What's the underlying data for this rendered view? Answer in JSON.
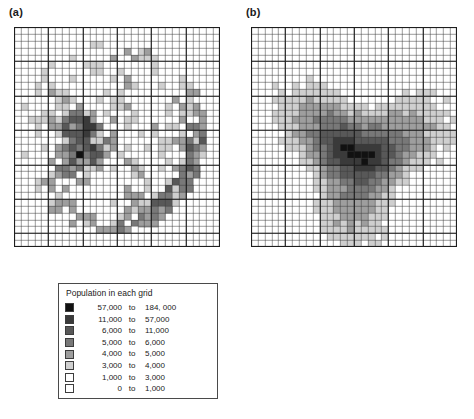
{
  "figure": {
    "type": "raster-map-pair",
    "background": "#ffffff"
  },
  "panels": [
    {
      "id": "a",
      "label": "(a)",
      "map_name": "population-density-grid-map",
      "grid": {
        "cols": 30,
        "rows": 32,
        "major_every": 5,
        "line_color": "#3c3c3c"
      }
    },
    {
      "id": "b",
      "label": "(b)",
      "map_name": "so2-concentration-grid-map",
      "grid": {
        "cols": 30,
        "rows": 32,
        "major_every": 5,
        "line_color": "#3c3c3c"
      }
    }
  ],
  "legend_a": {
    "title": "Population in each grid",
    "to_label": "to",
    "rows": [
      {
        "color": "#111111",
        "low": "57,000",
        "high": "184, 000"
      },
      {
        "color": "#3a3a3a",
        "low": "11,000",
        "high": "57,000"
      },
      {
        "color": "#585858",
        "low": "6,000",
        "high": "11,000"
      },
      {
        "color": "#787878",
        "low": "5,000",
        "high": "6,000"
      },
      {
        "color": "#9e9e9e",
        "low": "4,000",
        "high": "5,000"
      },
      {
        "color": "#cfcfcf",
        "low": "3,000",
        "high": "4,000"
      },
      {
        "color": "#ffffff",
        "low": "1,000",
        "high": "3,000"
      },
      {
        "color": "#ffffff",
        "low": "0",
        "high": "1,000"
      }
    ]
  },
  "legend_b": {
    "title_prefix": "SO",
    "title_sub": "2",
    "title_mid": " concentration, µg/m",
    "title_sup": "3",
    "to_label": "to",
    "rows": [
      {
        "color": "#111111",
        "low": "0.036",
        "high": "0.0794"
      },
      {
        "color": "#3a3a3a",
        "low": "0.0151",
        "high": "0.036"
      },
      {
        "color": "#585858",
        "low": "0.0078",
        "high": "0.0151"
      },
      {
        "color": "#787878",
        "low": "0.0045",
        "high": "0.0078"
      },
      {
        "color": "#9e9e9e",
        "low": "0.0028",
        "high": "0.0045"
      },
      {
        "color": "#cfcfcf",
        "low": "0.0016",
        "high": "0.0028"
      },
      {
        "color": "#ffffff",
        "low": "0.0011",
        "high": "0.0016"
      },
      {
        "color": "#ffffff",
        "low": "0.0001",
        "high": "0.0011"
      }
    ]
  },
  "chart_data": {
    "type": "heatmap",
    "title": "",
    "panels": [
      {
        "name": "(a) Population in each grid",
        "unit": "persons per grid cell",
        "class_breaks": [
          0,
          1000,
          3000,
          4000,
          5000,
          6000,
          11000,
          57000,
          184000
        ],
        "class_colors": [
          "#ffffff",
          "#ffffff",
          "#cfcfcf",
          "#9e9e9e",
          "#787878",
          "#585858",
          "#3a3a3a",
          "#111111"
        ],
        "grid_cols": 30,
        "grid_rows": 32,
        "shape": "irregular circular city boundary, clipped to circle",
        "pattern": "dense dark core slightly left-of-centre with radiating mottled mid-grey sectors; bright white interior wedge in lower-centre; dark ring along south-east and south rim",
        "peak_class": "57,000 to 184,000",
        "peak_location_rel": [
          0.32,
          0.52
        ]
      },
      {
        "name": "(b) SO2 concentration",
        "unit": "µg/m3",
        "class_breaks": [
          0.0001,
          0.0011,
          0.0016,
          0.0028,
          0.0045,
          0.0078,
          0.0151,
          0.036,
          0.0794
        ],
        "class_colors": [
          "#ffffff",
          "#ffffff",
          "#cfcfcf",
          "#9e9e9e",
          "#787878",
          "#585858",
          "#3a3a3a",
          "#111111"
        ],
        "grid_cols": 30,
        "grid_rows": 32,
        "shape": "smooth radially decaying plume filling whole grid",
        "pattern": "single concentrated dark maximum just below and right of centre, with concentric smoothly decreasing grey shells and a lobed light-grey periphery",
        "peak_class": "0.036 to 0.0794",
        "peak_location_rel": [
          0.52,
          0.58
        ]
      }
    ],
    "legend_position": "below each panel",
    "grid": true
  }
}
